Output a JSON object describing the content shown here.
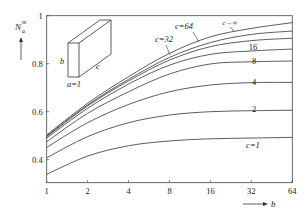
{
  "chart_data": {
    "type": "line",
    "title": "",
    "xlabel": "b",
    "ylabel": "N_a^m",
    "ylabel_main": "N",
    "ylabel_sub": "a",
    "ylabel_sup": "m",
    "x_scale": "log2",
    "x": [
      1,
      2,
      4,
      8,
      16,
      32,
      64
    ],
    "x_tick_labels": [
      "1",
      "2",
      "4",
      "8",
      "16",
      "32",
      "64"
    ],
    "xlim": [
      1,
      64
    ],
    "ylim": [
      0.304,
      1.0
    ],
    "y_ticks": [
      0.4,
      0.6,
      0.8,
      1.0
    ],
    "y_tick_labels": [
      "0.4",
      "0.6",
      "0.8",
      "1"
    ],
    "grid": false,
    "legend_position": "inline labels",
    "series": [
      {
        "name": "c=1",
        "label": "c=1",
        "values": [
          0.339,
          0.415,
          0.458,
          0.478,
          0.487,
          0.49,
          0.493
        ]
      },
      {
        "name": "c=2",
        "label": "2",
        "values": [
          0.408,
          0.496,
          0.554,
          0.586,
          0.6,
          0.604,
          0.606
        ]
      },
      {
        "name": "c=4",
        "label": "4",
        "values": [
          0.451,
          0.554,
          0.63,
          0.683,
          0.711,
          0.721,
          0.722
        ]
      },
      {
        "name": "c=8",
        "label": "8",
        "values": [
          0.475,
          0.593,
          0.683,
          0.757,
          0.799,
          0.808,
          0.811
        ]
      },
      {
        "name": "c=16",
        "label": "16",
        "values": [
          0.49,
          0.614,
          0.715,
          0.794,
          0.839,
          0.853,
          0.861
        ]
      },
      {
        "name": "c=32",
        "label": "c=32",
        "values": [
          0.496,
          0.624,
          0.728,
          0.815,
          0.871,
          0.896,
          0.906
        ]
      },
      {
        "name": "c=64",
        "label": "c=64",
        "values": [
          0.499,
          0.628,
          0.735,
          0.826,
          0.888,
          0.922,
          0.936
        ]
      },
      {
        "name": "c→∞",
        "label": "c→∞",
        "values": [
          0.503,
          0.635,
          0.746,
          0.843,
          0.912,
          0.947,
          0.971
        ]
      }
    ],
    "annotations": [
      {
        "text": "c=1",
        "near": "c=1 curve",
        "b": 32
      },
      {
        "text": "2",
        "near": "c=2 curve",
        "b": 32
      },
      {
        "text": "4",
        "near": "c=4 curve",
        "b": 32
      },
      {
        "text": "8",
        "near": "c=8 curve",
        "b": 32
      },
      {
        "text": "16",
        "near": "c=16 curve",
        "b": 32
      },
      {
        "text": "c=32",
        "near": "c=32 curve",
        "b": 8,
        "leader_line": true
      },
      {
        "text": "c=64",
        "near": "c=64 curve",
        "b": 13,
        "leader_line": true
      },
      {
        "text": "c→∞",
        "near": "c→∞ curve",
        "b": 27,
        "leader_line": true
      }
    ],
    "inset": {
      "description": "rectangular prism with edge labels",
      "labels": {
        "a": "a=1",
        "b": "b",
        "c": "c"
      }
    }
  },
  "style": {
    "line_color": "#333333",
    "axis_color": "#444444",
    "text_color": "#222222"
  }
}
